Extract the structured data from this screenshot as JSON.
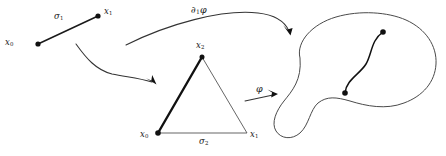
{
  "figure": {
    "background_color": "#ffffff",
    "stroke_color": "#1a1a1a",
    "thin_stroke_color": "#555555",
    "width": 446,
    "height": 156
  },
  "one_simplex": {
    "name": "1-simplex",
    "edge_label": "σ",
    "edge_label_sub": "1",
    "vertex_start_label": "x",
    "vertex_start_sub": "0",
    "vertex_end_label": "x",
    "vertex_end_sub": "1",
    "start_point": [
      38,
      44
    ],
    "end_point": [
      98,
      16
    ]
  },
  "two_simplex": {
    "name": "2-simplex",
    "apex_label": "x",
    "apex_sub": "2",
    "left_label": "x",
    "left_sub": "0",
    "right_label": "x",
    "right_sub": "1",
    "base_label": "σ",
    "base_sub": "2",
    "apex_point": [
      202,
      57
    ],
    "left_point": [
      158,
      133
    ],
    "right_point": [
      247,
      133
    ]
  },
  "manifold": {
    "name": "manifold-blob",
    "curve_start_point": [
      345,
      93
    ],
    "curve_end_point": [
      383,
      32
    ],
    "curve_label": ""
  },
  "arrows": {
    "top": {
      "label": "∂",
      "label_sub": "1",
      "label_tail": "φ",
      "name": "boundary-map-arrow"
    },
    "middle": {
      "label": "",
      "name": "face-inclusion-arrow"
    },
    "lower": {
      "label": "φ",
      "name": "singular-simplex-map-arrow"
    }
  }
}
